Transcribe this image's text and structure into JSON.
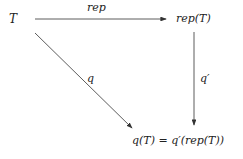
{
  "nodes": {
    "T": "T",
    "repT": "rep(T)",
    "result": "q(T) = q′(rep(T))"
  },
  "arrows": {
    "top": "rep",
    "diagonal": "q",
    "vertical": "q′"
  },
  "colors": {
    "line": "#333333",
    "text": "#222222"
  }
}
